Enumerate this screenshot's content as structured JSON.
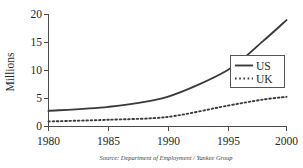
{
  "chart_data": {
    "type": "line",
    "title": "",
    "subtitle": "",
    "xlabel": "",
    "ylabel": "Millions",
    "x": [
      1980,
      1985,
      1990,
      1995,
      1998,
      2000
    ],
    "xlim": [
      1980,
      2000
    ],
    "ylim": [
      0,
      20
    ],
    "xticks": [
      "1980",
      "1985",
      "1990",
      "1995",
      "2000"
    ],
    "yticks": [
      "0",
      "5",
      "10",
      "15",
      "20"
    ],
    "grid": false,
    "legend_position": "center-right",
    "series": [
      {
        "name": "US",
        "style": "solid",
        "color": "#3a3a3a",
        "x": [
          1980,
          1985,
          1990,
          1995,
          1998,
          2000
        ],
        "values": [
          2.8,
          3.5,
          5.3,
          10.0,
          15.2,
          19.0
        ]
      },
      {
        "name": "UK",
        "style": "dotted",
        "color": "#3a3a3a",
        "x": [
          1980,
          1985,
          1990,
          1995,
          1998,
          2000
        ],
        "values": [
          0.9,
          1.2,
          1.7,
          3.7,
          4.8,
          5.3
        ]
      }
    ],
    "annotations": [
      "Source: Department of Employment / Yankee Group"
    ]
  },
  "axes": {
    "y_label": "Millions",
    "y_tick_labels": {
      "t0": "0",
      "t1": "5",
      "t2": "10",
      "t3": "15",
      "t4": "20"
    },
    "x_tick_labels": {
      "t0": "1980",
      "t1": "1985",
      "t2": "1990",
      "t3": "1995",
      "t4": "2000"
    }
  },
  "legend": {
    "entries": {
      "us": "US",
      "uk": "UK"
    }
  },
  "footer": {
    "source": "Source: Department of Employment / Yankee Group"
  }
}
